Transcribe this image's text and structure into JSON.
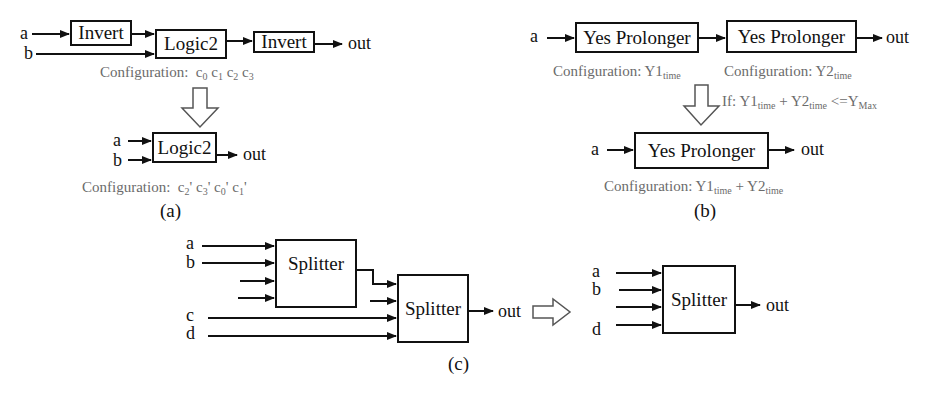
{
  "panel_a": {
    "caption": "(a)",
    "top": {
      "inputs": [
        "a",
        "b"
      ],
      "blocks": [
        "Invert",
        "Logic2",
        "Invert"
      ],
      "output": "out",
      "config_label": "Configuration:",
      "config_terms": [
        {
          "c": "c",
          "s": "0"
        },
        {
          "c": "c",
          "s": "1"
        },
        {
          "c": "c",
          "s": "2"
        },
        {
          "c": "c",
          "s": "3"
        }
      ]
    },
    "bottom": {
      "inputs": [
        "a",
        "b"
      ],
      "block": "Logic2",
      "output": "out",
      "config_label": "Configuration:",
      "config_terms": [
        {
          "c": "c",
          "s": "2",
          "p": "'"
        },
        {
          "c": "c",
          "s": "3",
          "p": "'"
        },
        {
          "c": "c",
          "s": "0",
          "p": "'"
        },
        {
          "c": "c",
          "s": "1",
          "p": "'"
        }
      ]
    }
  },
  "panel_b": {
    "caption": "(b)",
    "top": {
      "input": "a",
      "blocks": [
        "Yes Prolonger",
        "Yes Prolonger"
      ],
      "output": "out",
      "config1": {
        "label": "Configuration:",
        "var": "Y1",
        "sub": "time"
      },
      "config2": {
        "label": "Configuration:",
        "var": "Y2",
        "sub": "time"
      }
    },
    "condition": {
      "prefix": "If:",
      "v1": "Y1",
      "s1": "time",
      "op": "+",
      "v2": "Y2",
      "s2": "time",
      "cmp": "<=",
      "v3": "Y",
      "s3": "Max"
    },
    "bottom": {
      "input": "a",
      "block": "Yes Prolonger",
      "output": "out",
      "config": {
        "label": "Configuration:",
        "v1": "Y1",
        "s1": "time",
        "op": "+",
        "v2": "Y2",
        "s2": "time"
      }
    }
  },
  "panel_c": {
    "caption": "(c)",
    "left": {
      "inputs_first": [
        "a",
        "b"
      ],
      "inputs_second": [
        "c",
        "d"
      ],
      "blocks": [
        "Splitter",
        "Splitter"
      ],
      "output": "out"
    },
    "right": {
      "inputs": [
        "a",
        "b",
        "",
        "d"
      ],
      "block": "Splitter",
      "output": "out"
    }
  }
}
